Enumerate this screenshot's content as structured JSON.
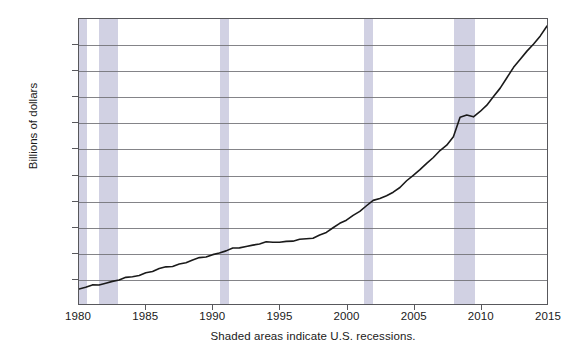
{
  "chart_data": {
    "type": "line",
    "title": "",
    "subtitle": "",
    "xlabel": "",
    "ylabel": "Billions of dollars",
    "caption": "Shaded areas indicate U.S. recessions.",
    "xlim": [
      1980,
      2015
    ],
    "ylim": [
      1000,
      12000
    ],
    "xticks": [
      1980,
      1985,
      1990,
      1995,
      2000,
      2005,
      2010,
      2015
    ],
    "xtick_labels": [
      "1980",
      "1985",
      "1990",
      "1995",
      "2000",
      "2005",
      "2010",
      "2015"
    ],
    "yticks": [
      1000,
      2000,
      3000,
      4000,
      5000,
      6000,
      7000,
      8000,
      9000,
      10000,
      11000,
      12000
    ],
    "ytick_labels": [
      "1,000",
      "2,000",
      "3,000",
      "4,000",
      "5,000",
      "6,000",
      "7,000",
      "8,000",
      "9,000",
      "10,000",
      "11,000",
      "12,000"
    ],
    "grid": "horizontal",
    "legend": "none",
    "line_color": "#1a1a1a",
    "shaded_band_color": "#c9c9de",
    "shaded_bands": [
      {
        "label": "1980 recession",
        "x0": 1980.0,
        "x1": 1980.6
      },
      {
        "label": "1981-82 recession",
        "x0": 1981.5,
        "x1": 1982.9
      },
      {
        "label": "1990-91 recession",
        "x0": 1990.5,
        "x1": 1991.2
      },
      {
        "label": "2001 recession",
        "x0": 2001.2,
        "x1": 2001.9
      },
      {
        "label": "2007-09 recession",
        "x0": 2007.9,
        "x1": 2009.5
      }
    ],
    "series": [
      {
        "name": "Billions of dollars",
        "x": [
          1980.0,
          1980.5,
          1981.0,
          1981.5,
          1982.0,
          1982.5,
          1983.0,
          1983.5,
          1984.0,
          1984.5,
          1985.0,
          1985.5,
          1986.0,
          1986.5,
          1987.0,
          1987.5,
          1988.0,
          1988.5,
          1989.0,
          1989.5,
          1990.0,
          1990.5,
          1991.0,
          1991.5,
          1992.0,
          1992.5,
          1993.0,
          1993.5,
          1994.0,
          1994.5,
          1995.0,
          1995.5,
          1996.0,
          1996.5,
          1997.0,
          1997.5,
          1998.0,
          1998.5,
          1999.0,
          1999.5,
          2000.0,
          2000.5,
          2001.0,
          2001.5,
          2002.0,
          2002.5,
          2003.0,
          2003.5,
          2004.0,
          2004.5,
          2005.0,
          2005.5,
          2006.0,
          2006.5,
          2007.0,
          2007.5,
          2008.0,
          2008.5,
          2009.0,
          2009.5,
          2010.0,
          2010.5,
          2011.0,
          2011.5,
          2012.0,
          2012.5,
          2013.0,
          2013.5,
          2014.0,
          2014.5,
          2015.0
        ],
        "y": [
          1580,
          1640,
          1700,
          1760,
          1820,
          1870,
          1930,
          1990,
          2060,
          2130,
          2200,
          2270,
          2340,
          2420,
          2480,
          2540,
          2610,
          2680,
          2760,
          2840,
          2910,
          2980,
          3050,
          3120,
          3180,
          3230,
          3280,
          3330,
          3360,
          3380,
          3400,
          3420,
          3450,
          3470,
          3500,
          3560,
          3660,
          3790,
          3930,
          4080,
          4250,
          4420,
          4600,
          4800,
          4960,
          5080,
          5180,
          5330,
          5520,
          5720,
          5960,
          6190,
          6430,
          6690,
          6900,
          7110,
          7460,
          8200,
          8330,
          8220,
          8400,
          8680,
          9000,
          9360,
          9750,
          10100,
          10450,
          10750,
          11050,
          11380,
          11700
        ]
      }
    ]
  },
  "axes": {
    "y_title": "Billions of dollars",
    "x_caption": "Shaded areas indicate U.S. recessions."
  }
}
